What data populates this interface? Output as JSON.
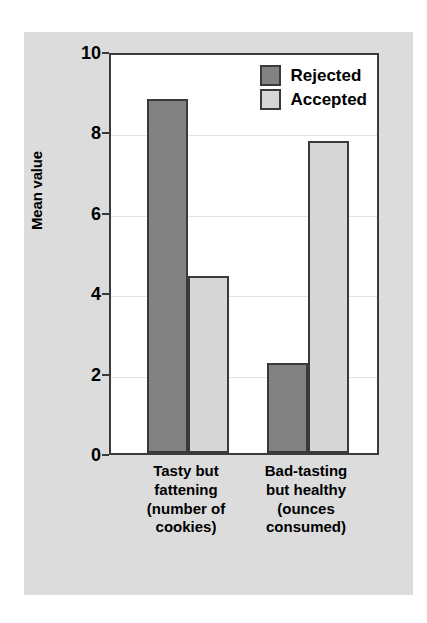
{
  "chart_data": {
    "type": "bar",
    "title": "",
    "subtitle": "",
    "xlabel": "",
    "ylabel": "Mean value",
    "ylim": [
      0,
      10
    ],
    "ytick_labels": [
      "10",
      "8",
      "6",
      "4",
      "2",
      "0"
    ],
    "ytick_values": [
      10,
      8,
      6,
      4,
      2,
      0
    ],
    "grid": true,
    "legend_position": "top-right",
    "categories": [
      "Tasty but fattening (number of cookies)",
      "Bad-tasting but healthy (ounces consumed)"
    ],
    "category_lines": [
      [
        "Tasty but",
        "fattening",
        "(number of",
        "cookies)"
      ],
      [
        "Bad-tasting",
        "but healthy",
        "(ounces",
        "consumed)"
      ]
    ],
    "series": [
      {
        "name": "Rejected",
        "color": "#828282",
        "values": [
          8.8,
          2.25
        ]
      },
      {
        "name": "Accepted",
        "color": "#d6d6d6",
        "values": [
          4.4,
          7.75
        ]
      }
    ]
  },
  "legend": {
    "items": [
      {
        "label": "Rejected"
      },
      {
        "label": "Accepted"
      }
    ]
  },
  "colors": {
    "panel_background": "#dcdcdc",
    "plot_background": "#ffffff",
    "axis": "#3a3a3a",
    "gridline": "#e2e2e2",
    "rejected": "#828282",
    "accepted": "#d6d6d6"
  }
}
